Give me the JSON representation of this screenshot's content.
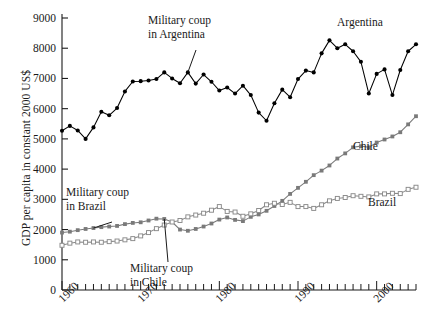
{
  "chart_data": {
    "type": "line",
    "title": "",
    "xlabel": "",
    "ylabel": "GDP per capita in constant 2000 US$",
    "xlim": [
      1960,
      2005
    ],
    "ylim": [
      0,
      9000
    ],
    "ytick_step": 1000,
    "xtick_step": 1,
    "grid": false,
    "legend_position": "inline-series-labels",
    "ytick_labels": [
      "0",
      "1000",
      "2000",
      "3000",
      "4000",
      "5000",
      "6000",
      "7000",
      "8000",
      "9000"
    ],
    "xtick_labels": [
      "1960",
      "1970",
      "1980",
      "1990",
      "2000"
    ],
    "xtick_label_years": [
      1960,
      1970,
      1980,
      1990,
      2000
    ],
    "x": [
      1960,
      1961,
      1962,
      1963,
      1964,
      1965,
      1966,
      1967,
      1968,
      1969,
      1970,
      1971,
      1972,
      1973,
      1974,
      1975,
      1976,
      1977,
      1978,
      1979,
      1980,
      1981,
      1982,
      1983,
      1984,
      1985,
      1986,
      1987,
      1988,
      1989,
      1990,
      1991,
      1992,
      1993,
      1994,
      1995,
      1996,
      1997,
      1998,
      1999,
      2000,
      2001,
      2002,
      2003,
      2004,
      2005
    ],
    "series": [
      {
        "name": "Argentina",
        "color": "#000000",
        "marker": "filled-circle",
        "values": [
          5270,
          5430,
          5280,
          5000,
          5380,
          5900,
          5780,
          6020,
          6570,
          6900,
          6910,
          6930,
          6980,
          7200,
          7000,
          6840,
          7200,
          6830,
          7130,
          6890,
          6600,
          6700,
          6500,
          6760,
          6450,
          5870,
          5600,
          6180,
          6630,
          6380,
          6980,
          7260,
          7200,
          7830,
          8260,
          8000,
          8130,
          7900,
          7550,
          6500,
          7150,
          7300,
          6450,
          7280,
          7900,
          8130
        ]
      },
      {
        "name": "Chile",
        "color": "#7a7a7a",
        "marker": "filled-square",
        "values": [
          1900,
          1930,
          1980,
          2020,
          2050,
          2080,
          2100,
          2120,
          2180,
          2220,
          2240,
          2300,
          2360,
          2350,
          2250,
          2000,
          1960,
          2020,
          2100,
          2200,
          2330,
          2400,
          2320,
          2280,
          2420,
          2500,
          2620,
          2780,
          2950,
          3180,
          3380,
          3580,
          3800,
          3950,
          4120,
          4350,
          4520,
          4720,
          4760,
          4720,
          4880,
          4980,
          5080,
          5220,
          5480,
          5750
        ]
      },
      {
        "name": "Brazil",
        "color": "#8a8a8a",
        "marker": "open-square",
        "values": [
          1480,
          1550,
          1590,
          1580,
          1590,
          1580,
          1600,
          1620,
          1660,
          1700,
          1790,
          1900,
          2030,
          2150,
          2250,
          2300,
          2420,
          2480,
          2540,
          2640,
          2760,
          2600,
          2580,
          2440,
          2520,
          2630,
          2820,
          2870,
          2830,
          2900,
          2760,
          2760,
          2700,
          2820,
          2950,
          3030,
          3060,
          3120,
          3100,
          3080,
          3180,
          3180,
          3200,
          3190,
          3330,
          3400
        ]
      }
    ],
    "annotations": [
      {
        "id": "coup-argentina",
        "line1": "Military coup",
        "line2": "in Argentina",
        "pointer_year": 1976,
        "pointer_value": 7200
      },
      {
        "id": "coup-brazil",
        "line1": "Military coup",
        "line2": "in Brazil",
        "pointer_year": 1964,
        "pointer_value": 2050
      },
      {
        "id": "coup-chile",
        "line1": "Military coup",
        "line2": "in Chile",
        "pointer_year": 1973,
        "pointer_value": 2350
      }
    ],
    "series_labels": [
      {
        "name": "Argentina"
      },
      {
        "name": "Chile"
      },
      {
        "name": "Brazil"
      }
    ]
  }
}
